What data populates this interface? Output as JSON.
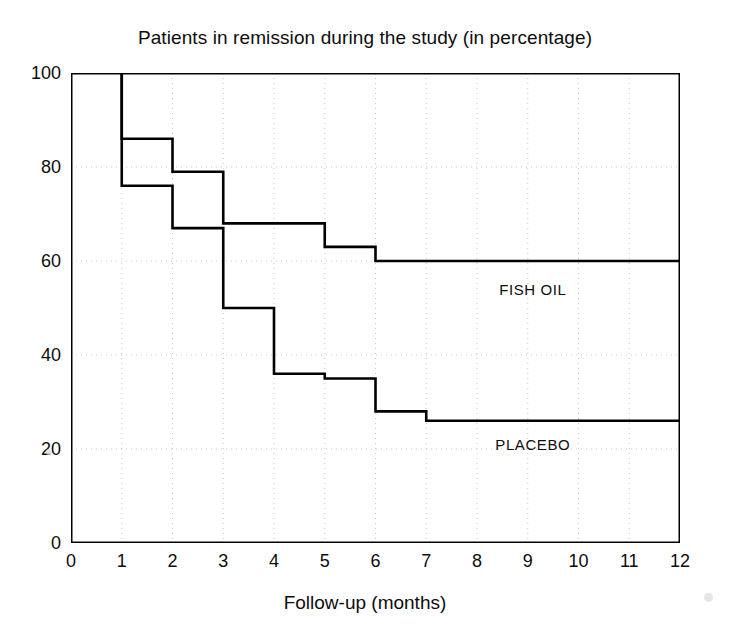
{
  "chart_data": {
    "type": "line",
    "subtype": "step",
    "title": "Patients in remission during the study (in percentage)",
    "xlabel": "Follow-up (months)",
    "ylabel": "",
    "xlim": [
      0,
      12
    ],
    "ylim": [
      0,
      100
    ],
    "xticks": [
      0,
      1,
      2,
      3,
      4,
      5,
      6,
      7,
      8,
      9,
      10,
      11,
      12
    ],
    "yticks": [
      0,
      20,
      40,
      60,
      80,
      100
    ],
    "xtick_labels": [
      "0",
      "1",
      "2",
      "3",
      "4",
      "5",
      "6",
      "7",
      "8",
      "9",
      "10",
      "11",
      "12"
    ],
    "ytick_labels": [
      "0",
      "20",
      "40",
      "60",
      "80",
      "100"
    ],
    "grid": "dotted-gray-both-axes",
    "legend_position": "inline-right-of-curves",
    "line_color": "#000000",
    "grid_color": "#c8c8c8",
    "axis_color": "#000000",
    "series": [
      {
        "name": "FISH OIL",
        "label": "FISH OIL",
        "label_x": 9.1,
        "label_y": 54,
        "step_points": [
          {
            "x": 1,
            "y": 100
          },
          {
            "x": 1,
            "y": 86
          },
          {
            "x": 2,
            "y": 86
          },
          {
            "x": 2,
            "y": 79
          },
          {
            "x": 3,
            "y": 79
          },
          {
            "x": 3,
            "y": 68
          },
          {
            "x": 5,
            "y": 68
          },
          {
            "x": 5,
            "y": 63
          },
          {
            "x": 6,
            "y": 63
          },
          {
            "x": 6,
            "y": 60
          },
          {
            "x": 12,
            "y": 60
          }
        ]
      },
      {
        "name": "PLACEBO",
        "label": "PLACEBO",
        "label_x": 9.1,
        "label_y": 21,
        "step_points": [
          {
            "x": 1,
            "y": 100
          },
          {
            "x": 1,
            "y": 76
          },
          {
            "x": 2,
            "y": 76
          },
          {
            "x": 2,
            "y": 67
          },
          {
            "x": 3,
            "y": 67
          },
          {
            "x": 3,
            "y": 50
          },
          {
            "x": 4,
            "y": 50
          },
          {
            "x": 4,
            "y": 36
          },
          {
            "x": 5,
            "y": 36
          },
          {
            "x": 5,
            "y": 35
          },
          {
            "x": 6,
            "y": 35
          },
          {
            "x": 6,
            "y": 28
          },
          {
            "x": 7,
            "y": 28
          },
          {
            "x": 7,
            "y": 26
          },
          {
            "x": 12,
            "y": 26
          }
        ]
      }
    ]
  }
}
